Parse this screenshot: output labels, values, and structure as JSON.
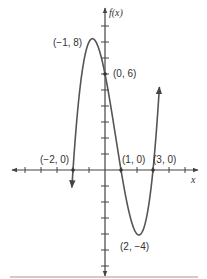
{
  "chart_data": {
    "type": "line",
    "title": "",
    "function": "f(x) = (x + 2)(x - 1)(x - 3)",
    "xlabel": "x",
    "ylabel": "f(x)",
    "xlim": [
      -5.8,
      5.8
    ],
    "ylim": [
      -6.6,
      10
    ],
    "grid": false,
    "x_ticks": [
      -5,
      -4,
      -3,
      -2,
      -1,
      1,
      2,
      3,
      4,
      5
    ],
    "y_ticks": [
      -6,
      -5,
      -4,
      -3,
      -2,
      -1,
      1,
      2,
      3,
      4,
      5,
      6,
      7,
      8,
      9
    ],
    "series": [
      {
        "name": "f(x)",
        "x": [
          -2.07,
          -2,
          -1.5,
          -1,
          -0.5,
          0,
          0.5,
          1,
          1.5,
          2,
          2.5,
          3,
          3.4
        ],
        "y": [
          -0.86,
          0,
          5.63,
          8,
          7.88,
          6,
          3.38,
          0,
          -2.63,
          -4,
          -3.38,
          0,
          4.62
        ]
      }
    ],
    "annotations": [
      {
        "label": "(-1, 8)",
        "x": -1,
        "y": 8,
        "type": "local maximum"
      },
      {
        "label": "(0, 6)",
        "x": 0,
        "y": 6,
        "type": "y-intercept"
      },
      {
        "label": "(-2, 0)",
        "x": -2,
        "y": 0,
        "type": "x-intercept"
      },
      {
        "label": "(1, 0)",
        "x": 1,
        "y": 0,
        "type": "x-intercept"
      },
      {
        "label": "(3, 0)",
        "x": 3,
        "y": 0,
        "type": "x-intercept"
      },
      {
        "label": "(2, -4)",
        "x": 2,
        "y": -4,
        "type": "local minimum"
      }
    ]
  },
  "labels": {
    "y_axis": "f(x)",
    "x_axis": "x",
    "max_point": "(−1, 8)",
    "y_intercept": "(0, 6)",
    "root_left": "(−2, 0)",
    "root_mid": "(1, 0)",
    "root_right": "(3, 0)",
    "min_point": "(2, −4)"
  },
  "colors": {
    "curve": "#555555",
    "axis": "#444444",
    "text": "#333333",
    "rule": "#bbbbbb"
  }
}
